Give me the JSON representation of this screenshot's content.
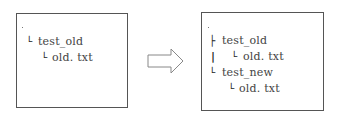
{
  "diagram": {
    "before": {
      "root": ".",
      "tree": [
        {
          "prefix": "└",
          "label": "test_old",
          "depth": 0
        },
        {
          "prefix": "└",
          "label": "old. txt",
          "depth": 1
        }
      ]
    },
    "arrow": {
      "direction": "right",
      "style": "outline"
    },
    "after": {
      "root": ".",
      "tree": [
        {
          "prefix": "├",
          "label": "test_old",
          "depth": 0
        },
        {
          "prefix": "└",
          "label": "old. txt",
          "depth": 1,
          "continuation": "|"
        },
        {
          "prefix": "└",
          "label": "test_new",
          "depth": 0
        },
        {
          "prefix": "└",
          "label": "old. txt",
          "depth": 1
        }
      ]
    },
    "colors": {
      "border": "#555555",
      "text": "#444444",
      "arrow": "#888888"
    }
  }
}
